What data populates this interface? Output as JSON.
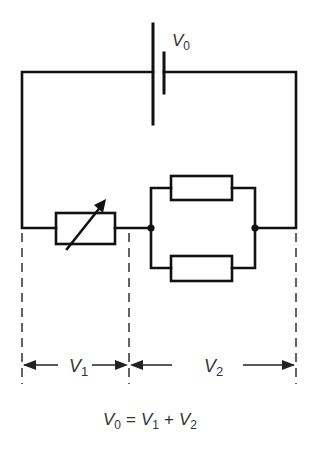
{
  "diagram": {
    "type": "circuit",
    "colors": {
      "wire": "#111111",
      "text": "#333333",
      "background": "#ffffff"
    },
    "battery": {
      "label": "V",
      "label_sub": "0"
    },
    "components": [
      {
        "id": "variable-resistor",
        "kind": "variable resistor (rheostat)"
      },
      {
        "id": "resistor-top",
        "kind": "resistor",
        "arrangement": "parallel"
      },
      {
        "id": "resistor-bottom",
        "kind": "resistor",
        "arrangement": "parallel"
      }
    ],
    "measurements": [
      {
        "label": "V",
        "sub": "1"
      },
      {
        "label": "V",
        "sub": "2"
      }
    ],
    "equation": {
      "lhs": "V",
      "lhs_sub": "0",
      "eq": "=",
      "t1": "V",
      "t1_sub": "1",
      "plus": "+",
      "t2": "V",
      "t2_sub": "2"
    }
  }
}
